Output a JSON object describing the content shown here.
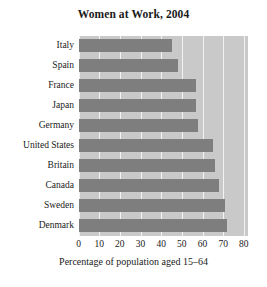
{
  "chart_data": {
    "type": "bar",
    "orientation": "horizontal",
    "title": "Women at Work, 2004",
    "xlabel": "Percentage of population aged 15–64",
    "ylabel": "",
    "categories": [
      "Italy",
      "Spain",
      "France",
      "Japan",
      "Germany",
      "United States",
      "Britain",
      "Canada",
      "Sweden",
      "Denmark"
    ],
    "values": [
      45,
      48,
      57,
      57,
      58,
      65,
      66,
      68,
      71,
      72
    ],
    "xlim": [
      0,
      82
    ],
    "ylim": [
      0,
      10
    ],
    "xticks": [
      0,
      10,
      20,
      30,
      40,
      50,
      60,
      70,
      80
    ],
    "xtick_labels": [
      "0",
      "10",
      "20",
      "30",
      "40",
      "50",
      "60",
      "70",
      "80"
    ],
    "grid": "vertical-white-gridlines",
    "legend": null,
    "colors": {
      "bar": "#7e7e7e",
      "plot_background": "#c9c9c9",
      "gridline": "#f2f2f2",
      "figure_background": "#ffffff",
      "text": "#1a1a1a"
    }
  }
}
